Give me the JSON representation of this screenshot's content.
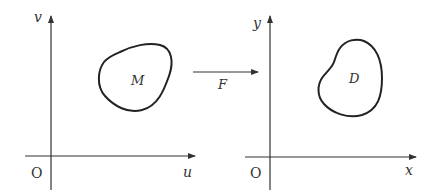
{
  "diagram": {
    "colors": {
      "stroke": "#222222",
      "axis": "#333333",
      "text": "#333333",
      "background": "#ffffff"
    },
    "left_panel": {
      "origin_label": "O",
      "horizontal_axis_label": "u",
      "vertical_axis_label": "v",
      "region_label": "M"
    },
    "mapping": {
      "label": "F"
    },
    "right_panel": {
      "origin_label": "O",
      "horizontal_axis_label": "x",
      "vertical_axis_label": "y",
      "region_label": "D"
    }
  }
}
